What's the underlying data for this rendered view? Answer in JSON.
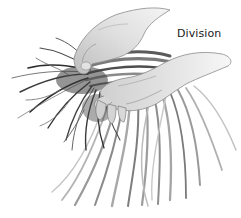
{
  "figure": {
    "caption": "Division",
    "palette": {
      "background": "#ffffff",
      "ink_dark": "#2a2a2a",
      "ink_mid": "#6e6e6e",
      "ink_light": "#b5b5b5",
      "skin_shade": "#d4d4d4",
      "skin_light": "#ececec"
    }
  }
}
